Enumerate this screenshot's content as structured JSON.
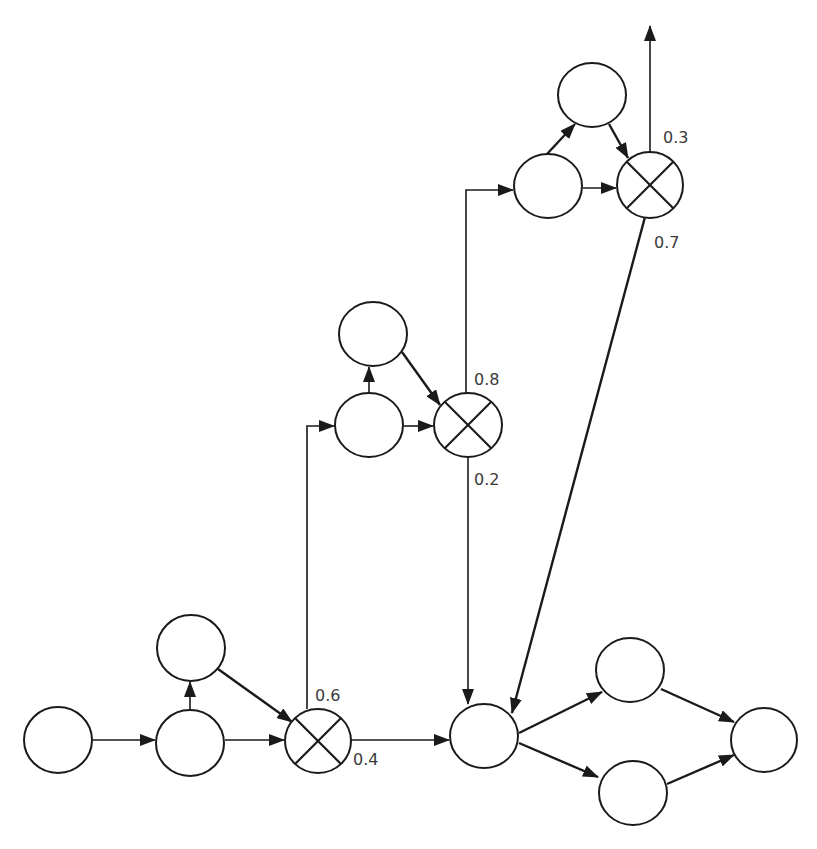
{
  "diagram": {
    "type": "probabilistic-flow-network",
    "colors": {
      "stroke": "#1a1a1a",
      "fill": "#ffffff",
      "label": "#3a3a3a"
    },
    "nodes": [
      {
        "id": "n1",
        "kind": "activity",
        "cx": 58,
        "cy": 740,
        "rx": 34,
        "ry": 33
      },
      {
        "id": "n2",
        "kind": "activity",
        "cx": 190,
        "cy": 743,
        "rx": 34,
        "ry": 33
      },
      {
        "id": "n3",
        "kind": "activity",
        "cx": 191,
        "cy": 648,
        "rx": 34,
        "ry": 33
      },
      {
        "id": "x1",
        "kind": "xor-split",
        "cx": 318,
        "cy": 741,
        "rx": 33,
        "ry": 32
      },
      {
        "id": "n4",
        "kind": "activity",
        "cx": 369,
        "cy": 425,
        "rx": 34,
        "ry": 32
      },
      {
        "id": "n5",
        "kind": "activity",
        "cx": 373,
        "cy": 334,
        "rx": 34,
        "ry": 32
      },
      {
        "id": "x2",
        "kind": "xor-split",
        "cx": 468,
        "cy": 425,
        "rx": 34,
        "ry": 32
      },
      {
        "id": "n6",
        "kind": "activity",
        "cx": 548,
        "cy": 186,
        "rx": 34,
        "ry": 32
      },
      {
        "id": "n7",
        "kind": "activity",
        "cx": 592,
        "cy": 95,
        "rx": 34,
        "ry": 32
      },
      {
        "id": "x3",
        "kind": "xor-split",
        "cx": 650,
        "cy": 185,
        "rx": 33,
        "ry": 33
      },
      {
        "id": "n8",
        "kind": "activity",
        "cx": 484,
        "cy": 736,
        "rx": 34,
        "ry": 32
      },
      {
        "id": "n9",
        "kind": "activity",
        "cx": 630,
        "cy": 670,
        "rx": 34,
        "ry": 32
      },
      {
        "id": "n10",
        "kind": "activity",
        "cx": 633,
        "cy": 793,
        "rx": 34,
        "ry": 32
      },
      {
        "id": "n11",
        "kind": "activity",
        "cx": 764,
        "cy": 740,
        "rx": 33,
        "ry": 32
      }
    ],
    "edges": [
      {
        "from": "n1",
        "to": "n2"
      },
      {
        "from": "n2",
        "to": "n3"
      },
      {
        "from": "n2",
        "to": "x1"
      },
      {
        "from": "n3",
        "to": "x1"
      },
      {
        "from": "x1",
        "to": "n4",
        "probability": "0.6"
      },
      {
        "from": "x1",
        "to": "n8",
        "probability": "0.4"
      },
      {
        "from": "n4",
        "to": "n5"
      },
      {
        "from": "n4",
        "to": "x2"
      },
      {
        "from": "n5",
        "to": "x2"
      },
      {
        "from": "x2",
        "to": "n6",
        "probability": "0.8"
      },
      {
        "from": "x2",
        "to": "n8",
        "probability": "0.2"
      },
      {
        "from": "n6",
        "to": "n7"
      },
      {
        "from": "n6",
        "to": "x3"
      },
      {
        "from": "n7",
        "to": "x3"
      },
      {
        "from": "x3",
        "to": "exit",
        "probability": "0.3"
      },
      {
        "from": "x3",
        "to": "n8",
        "probability": "0.7"
      },
      {
        "from": "n8",
        "to": "n9"
      },
      {
        "from": "n8",
        "to": "n10"
      },
      {
        "from": "n9",
        "to": "n11"
      },
      {
        "from": "n10",
        "to": "n11"
      }
    ],
    "labels": {
      "x1_up": "0.6",
      "x1_right": "0.4",
      "x2_up": "0.8",
      "x2_down": "0.2",
      "x3_up": "0.3",
      "x3_down": "0.7"
    }
  }
}
